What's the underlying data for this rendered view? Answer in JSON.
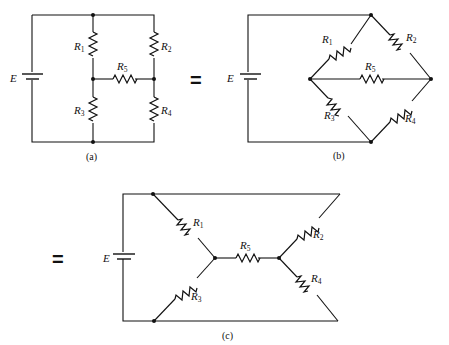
{
  "figure": {
    "equals_symbol": "=",
    "source_label": "E",
    "resistors": [
      "R1",
      "R2",
      "R3",
      "R4",
      "R5"
    ],
    "panels": [
      {
        "id": "a",
        "caption": "(a)",
        "labels": {
          "E": "E",
          "R1": "R",
          "R1_sub": "1",
          "R2": "R",
          "R2_sub": "2",
          "R3": "R",
          "R3_sub": "3",
          "R4": "R",
          "R4_sub": "4",
          "R5": "R",
          "R5_sub": "5"
        }
      },
      {
        "id": "b",
        "caption": "(b)",
        "labels": {
          "E": "E",
          "R1": "R",
          "R1_sub": "1",
          "R2": "R",
          "R2_sub": "2",
          "R3": "R",
          "R3_sub": "3",
          "R4": "R",
          "R4_sub": "4",
          "R5": "R",
          "R5_sub": "5"
        }
      },
      {
        "id": "c",
        "caption": "(c)",
        "labels": {
          "E": "E",
          "R1": "R",
          "R1_sub": "1",
          "R2": "R",
          "R2_sub": "2",
          "R3": "R",
          "R3_sub": "3",
          "R4": "R",
          "R4_sub": "4",
          "R5": "R",
          "R5_sub": "5"
        }
      }
    ]
  }
}
